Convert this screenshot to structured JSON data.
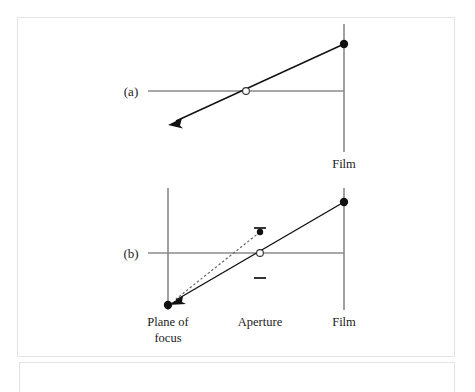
{
  "figure": {
    "type": "optics-ray-diagram",
    "background_color": "#ffffff",
    "frame_border_color": "#e3e3e3",
    "ray_color": "#111111",
    "axis_color": "#8a8a8a",
    "dashed_ray_color": "#666666"
  },
  "panels": [
    {
      "id": "a",
      "label": "(a)",
      "label_x": 131,
      "label_y": 96,
      "optical_axis": {
        "x1": 148,
        "y1": 91,
        "x2": 344,
        "y2": 91
      },
      "planes": [
        {
          "name": "film",
          "label": "Film",
          "x": 344,
          "y1": 24,
          "y2": 152,
          "label_x": 344,
          "label_y": 168
        }
      ],
      "aperture": {
        "x": 246,
        "y": 91,
        "r": 3.4,
        "style": "open-circle"
      },
      "points": [
        {
          "name": "image-point-on-film",
          "x": 344,
          "y": 44,
          "r": 4.2,
          "style": "filled"
        }
      ],
      "rays": [
        {
          "name": "chief-ray",
          "style": "solid",
          "x1": 344,
          "y1": 44,
          "x2": 170,
          "y2": 124,
          "arrow_at_end": true
        }
      ]
    },
    {
      "id": "b",
      "label": "(b)",
      "label_x": 131,
      "label_y": 258,
      "optical_axis": {
        "x1": 148,
        "y1": 253,
        "x2": 344,
        "y2": 253
      },
      "planes": [
        {
          "name": "plane-of-focus",
          "label": "Plane of",
          "label_line2": "focus",
          "x": 168,
          "y1": 188,
          "y2": 310,
          "label_x": 168,
          "label_y": 326,
          "label_y2": 342
        },
        {
          "name": "film",
          "label": "Film",
          "x": 344,
          "y1": 188,
          "y2": 310,
          "label_x": 344,
          "label_y": 326
        }
      ],
      "aperture": {
        "x": 260,
        "y": 253,
        "r": 3.4,
        "style": "open-circle",
        "label": "Aperture",
        "label_x": 260,
        "label_y": 326,
        "blades": [
          {
            "name": "upper-blade",
            "x1": 254,
            "y1": 228,
            "x2": 266,
            "y2": 228
          },
          {
            "name": "lower-blade",
            "x1": 254,
            "y1": 278,
            "x2": 266,
            "y2": 278
          }
        ]
      },
      "points": [
        {
          "name": "object-point-plane-of-focus",
          "x": 168,
          "y": 305,
          "r": 4.2,
          "style": "filled"
        },
        {
          "name": "image-point-on-film",
          "x": 344,
          "y": 202,
          "r": 4.2,
          "style": "filled"
        },
        {
          "name": "off-axis-point",
          "x": 260,
          "y": 232,
          "r": 3.2,
          "style": "filled"
        }
      ],
      "rays": [
        {
          "name": "chief-ray-solid",
          "style": "solid",
          "x1": 344,
          "y1": 202,
          "x2": 168,
          "y2": 305,
          "arrow_at_end": true
        },
        {
          "name": "blurred-ray-dashed",
          "style": "dashed",
          "x1": 260,
          "y1": 232,
          "x2": 168,
          "y2": 305,
          "arrow_at_end": true
        }
      ]
    }
  ],
  "labels": {
    "panel_a": "(a)",
    "panel_b": "(b)",
    "film_a": "Film",
    "film_b": "Film",
    "aperture": "Aperture",
    "plane_of_focus_line1": "Plane of",
    "plane_of_focus_line2": "focus"
  }
}
